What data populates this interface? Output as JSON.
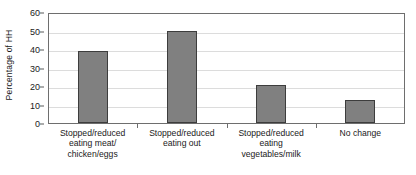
{
  "chart_data": {
    "type": "bar",
    "title": "",
    "xlabel": "",
    "ylabel": "Percentage of HH",
    "ylim": [
      0,
      60
    ],
    "ytick_step": 10,
    "yticks": [
      0,
      10,
      20,
      30,
      40,
      50,
      60
    ],
    "grid": true,
    "legend": false,
    "categories": [
      "Stopped/reduced eating meat/chicken/eggs",
      "Stopped/reduced eating out",
      "Stopped/reduced eating vegetables/milk",
      "No change"
    ],
    "category_lines": [
      [
        "Stopped/reduced",
        "eating meat/",
        "chicken/eggs"
      ],
      [
        "Stopped/reduced",
        "eating out"
      ],
      [
        "Stopped/reduced",
        "eating",
        "vegetables/milk"
      ],
      [
        "No change"
      ]
    ],
    "values": [
      39,
      49.5,
      20.5,
      12.5
    ],
    "bar_color": "#808080",
    "bar_edge_color": "#3d3d3d",
    "gridline_color": "#dcdcdc",
    "axis_color": "#6e6e6e"
  }
}
